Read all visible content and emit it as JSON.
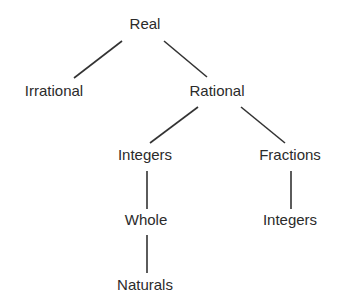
{
  "diagram": {
    "type": "tree",
    "title": "",
    "colors": {
      "text": "#2b2b2b",
      "lines": "#333333",
      "background": "#ffffff"
    },
    "nodes": [
      {
        "id": "real",
        "label": "Real",
        "x": 145,
        "y": 16
      },
      {
        "id": "irrational",
        "label": "Irrational",
        "x": 54,
        "y": 83
      },
      {
        "id": "rational",
        "label": "Rational",
        "x": 217,
        "y": 83
      },
      {
        "id": "integers",
        "label": "Integers",
        "x": 145,
        "y": 147
      },
      {
        "id": "fractions",
        "label": "Fractions",
        "x": 290,
        "y": 147
      },
      {
        "id": "whole",
        "label": "Whole",
        "x": 146,
        "y": 212
      },
      {
        "id": "integers2",
        "label": "Integers",
        "x": 290,
        "y": 212
      },
      {
        "id": "naturals",
        "label": "Naturals",
        "x": 145,
        "y": 277
      }
    ],
    "edges": [
      {
        "from": "real",
        "to": "irrational",
        "x1": 122,
        "y1": 41,
        "x2": 74,
        "y2": 78
      },
      {
        "from": "real",
        "to": "rational",
        "x1": 164,
        "y1": 41,
        "x2": 207,
        "y2": 77
      },
      {
        "from": "rational",
        "to": "integers",
        "x1": 198,
        "y1": 107,
        "x2": 150,
        "y2": 143
      },
      {
        "from": "rational",
        "to": "fractions",
        "x1": 241,
        "y1": 107,
        "x2": 285,
        "y2": 143
      },
      {
        "from": "integers",
        "to": "whole",
        "x1": 147,
        "y1": 171,
        "x2": 147,
        "y2": 209
      },
      {
        "from": "whole",
        "to": "naturals",
        "x1": 147,
        "y1": 235,
        "x2": 147,
        "y2": 273
      },
      {
        "from": "fractions",
        "to": "integers2",
        "x1": 291,
        "y1": 171,
        "x2": 291,
        "y2": 209
      }
    ]
  }
}
